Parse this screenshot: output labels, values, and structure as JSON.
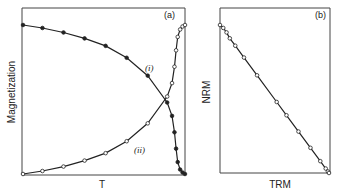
{
  "chart_data": [
    {
      "type": "line",
      "panel_label": "(a)",
      "title": "",
      "xlabel": "T",
      "ylabel": "Magnetization",
      "grid": false,
      "legend": "inline curve labels",
      "series": [
        {
          "name": "(i)",
          "marker": "filled-circle",
          "x": [
            0.0,
            0.12,
            0.25,
            0.38,
            0.51,
            0.64,
            0.77,
            0.89,
            0.92,
            0.935,
            0.945,
            0.955,
            0.97,
            0.985,
            1.0
          ],
          "y": [
            1.0,
            0.98,
            0.95,
            0.91,
            0.86,
            0.78,
            0.66,
            0.48,
            0.39,
            0.28,
            0.17,
            0.08,
            0.03,
            0.01,
            0.0
          ]
        },
        {
          "name": "(ii)",
          "marker": "open-circle",
          "x": [
            0.0,
            0.12,
            0.25,
            0.38,
            0.51,
            0.64,
            0.77,
            0.89,
            0.92,
            0.935,
            0.945,
            0.955,
            0.97,
            0.985,
            1.0
          ],
          "y": [
            0.0,
            0.02,
            0.05,
            0.09,
            0.14,
            0.22,
            0.34,
            0.52,
            0.61,
            0.72,
            0.83,
            0.92,
            0.97,
            0.99,
            1.0
          ]
        }
      ],
      "annotations": [
        "(i)",
        "(ii)"
      ]
    },
    {
      "type": "scatter",
      "panel_label": "(b)",
      "title": "",
      "xlabel": "TRM",
      "ylabel": "NRM",
      "grid": false,
      "series": [
        {
          "name": "NRM vs TRM",
          "marker": "open-circle",
          "fit_line": true,
          "x": [
            0.0,
            0.03,
            0.06,
            0.09,
            0.14,
            0.22,
            0.34,
            0.52,
            0.61,
            0.72,
            0.83,
            0.92,
            0.97,
            0.99,
            1.0
          ],
          "y": [
            1.0,
            0.98,
            0.95,
            0.91,
            0.86,
            0.78,
            0.66,
            0.48,
            0.39,
            0.28,
            0.17,
            0.08,
            0.03,
            0.01,
            0.0
          ]
        }
      ]
    }
  ]
}
